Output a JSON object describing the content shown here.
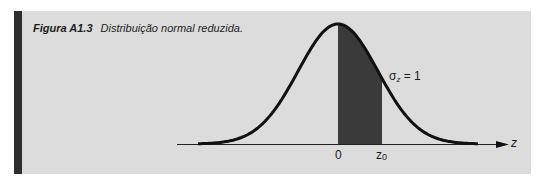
{
  "figure": {
    "label": "Figura A1.3",
    "caption": "Distribuição normal reduzida."
  },
  "colors": {
    "panel_bg": "#dcdcdc",
    "side_bar": "#2e2e2e",
    "curve": "#111111",
    "shade": "#3a3a3a"
  },
  "chart_data": {
    "type": "area",
    "title": "Distribuição normal reduzida.",
    "distribution": "standard normal",
    "mean": 0,
    "sigma_label": "σz = 1",
    "sigma": 1,
    "xlabel": "z",
    "ylabel": "",
    "x_ticks": [
      "0",
      "z0"
    ],
    "shaded_region": {
      "from": 0,
      "to": "z0",
      "z0_approx": 1.1
    },
    "x_range": [
      -3.5,
      3.5
    ],
    "grid": false,
    "legend": "none"
  },
  "labels": {
    "zero": "0",
    "z0": "z",
    "z0_sub": "0",
    "axis": "z",
    "sigma_sym": "σ",
    "sigma_sub": "z",
    "sigma_eq": " = 1"
  }
}
